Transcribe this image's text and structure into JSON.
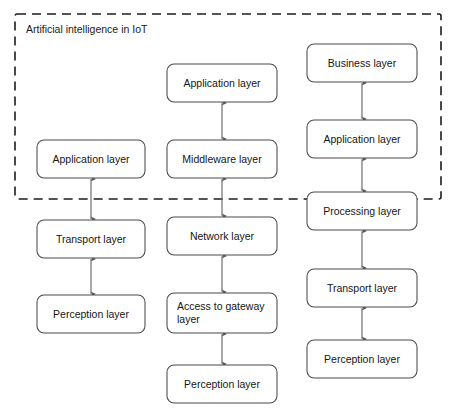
{
  "diagram": {
    "canvas": {
      "width": 456,
      "height": 420,
      "background": "#ffffff"
    },
    "boundary": {
      "label": "Artificial intelligence in IoT",
      "x": 15,
      "y": 14,
      "width": 426,
      "height": 185,
      "stroke": "#1c1c1c",
      "style": "dashed",
      "label_x": 26,
      "label_y": 33
    },
    "box_style": {
      "fill": "#ffffff",
      "stroke": "#4a4a4a",
      "corner_radius": 7,
      "stroke_width": 1.05
    },
    "arrow_style": {
      "stroke": "#5a5a5a",
      "double_headed": true,
      "head_length": 6,
      "head_width": 4
    },
    "columns": [
      {
        "name": "three-layer-architecture",
        "center_x": 91,
        "nodes": [
          {
            "id": "l-application",
            "label": "Application layer",
            "x": 37,
            "y": 140,
            "width": 108,
            "height": 38,
            "align": "center",
            "lines": [
              "Application layer"
            ]
          },
          {
            "id": "l-transport",
            "label": "Transport layer",
            "x": 37,
            "y": 220,
            "width": 108,
            "height": 38,
            "align": "center",
            "lines": [
              "Transport layer"
            ]
          },
          {
            "id": "l-perception",
            "label": "Perception layer",
            "x": 37,
            "y": 295,
            "width": 108,
            "height": 38,
            "align": "center",
            "lines": [
              "Perception layer"
            ]
          }
        ],
        "connectors": [
          {
            "from": "l-application",
            "to": "l-transport"
          },
          {
            "from": "l-transport",
            "to": "l-perception"
          }
        ]
      },
      {
        "name": "five-layer-architecture",
        "center_x": 222,
        "nodes": [
          {
            "id": "m-application",
            "label": "Application layer",
            "x": 167,
            "y": 64,
            "width": 110,
            "height": 38,
            "align": "center",
            "lines": [
              "Application layer"
            ]
          },
          {
            "id": "m-middleware",
            "label": "Middleware layer",
            "x": 167,
            "y": 140,
            "width": 110,
            "height": 38,
            "align": "center",
            "lines": [
              "Middleware layer"
            ]
          },
          {
            "id": "m-network",
            "label": "Network layer",
            "x": 167,
            "y": 217,
            "width": 110,
            "height": 38,
            "align": "center",
            "lines": [
              "Network layer"
            ]
          },
          {
            "id": "m-access",
            "label": "Access to gateway layer",
            "x": 167,
            "y": 293,
            "width": 110,
            "height": 40,
            "align": "left",
            "lines": [
              "Access to gateway",
              "layer"
            ]
          },
          {
            "id": "m-perception",
            "label": "Perception layer",
            "x": 167,
            "y": 365,
            "width": 110,
            "height": 38,
            "align": "center",
            "lines": [
              "Perception layer"
            ]
          }
        ],
        "connectors": [
          {
            "from": "m-application",
            "to": "m-middleware"
          },
          {
            "from": "m-middleware",
            "to": "m-network"
          },
          {
            "from": "m-network",
            "to": "m-access"
          },
          {
            "from": "m-access",
            "to": "m-perception"
          }
        ]
      },
      {
        "name": "five-layer-business-architecture",
        "center_x": 362,
        "nodes": [
          {
            "id": "r-business",
            "label": "Business layer",
            "x": 307,
            "y": 44,
            "width": 110,
            "height": 38,
            "align": "center",
            "lines": [
              "Business layer"
            ]
          },
          {
            "id": "r-application",
            "label": "Application layer",
            "x": 307,
            "y": 120,
            "width": 110,
            "height": 38,
            "align": "center",
            "lines": [
              "Application layer"
            ]
          },
          {
            "id": "r-processing",
            "label": "Processing layer",
            "x": 307,
            "y": 192,
            "width": 110,
            "height": 38,
            "align": "center",
            "lines": [
              "Processing layer"
            ]
          },
          {
            "id": "r-transport",
            "label": "Transport layer",
            "x": 307,
            "y": 269,
            "width": 110,
            "height": 38,
            "align": "center",
            "lines": [
              "Transport layer"
            ]
          },
          {
            "id": "r-perception",
            "label": "Perception layer",
            "x": 307,
            "y": 340,
            "width": 110,
            "height": 38,
            "align": "center",
            "lines": [
              "Perception layer"
            ]
          }
        ],
        "connectors": [
          {
            "from": "r-business",
            "to": "r-application"
          },
          {
            "from": "r-application",
            "to": "r-processing"
          },
          {
            "from": "r-processing",
            "to": "r-transport"
          },
          {
            "from": "r-transport",
            "to": "r-perception"
          }
        ]
      }
    ]
  }
}
